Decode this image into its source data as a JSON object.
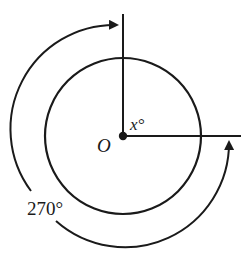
{
  "diagram": {
    "type": "circle-angle",
    "center_label": "O",
    "inner_angle_label": "x°",
    "outer_angle_label": "270°",
    "colors": {
      "stroke": "#1a1a1a",
      "background": "#ffffff"
    }
  }
}
